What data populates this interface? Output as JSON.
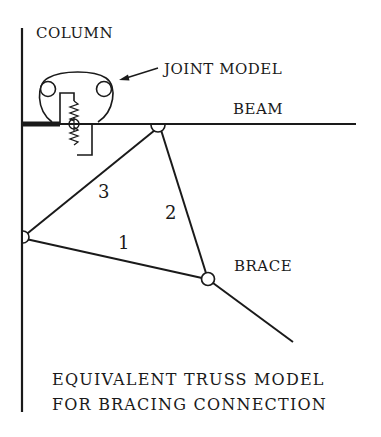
{
  "diagram": {
    "title_line1": "EQUIVALENT TRUSS MODEL",
    "title_line2": "FOR BRACING CONNECTION",
    "labels": {
      "column": "COLUMN",
      "joint_model": "JOINT MODEL",
      "beam": "BEAM",
      "brace": "BRACE"
    },
    "members": [
      {
        "id": "1",
        "label": "1"
      },
      {
        "id": "2",
        "label": "2"
      },
      {
        "id": "3",
        "label": "3"
      }
    ],
    "colors": {
      "ink": "#1a1a1a",
      "background": "#ffffff"
    }
  }
}
